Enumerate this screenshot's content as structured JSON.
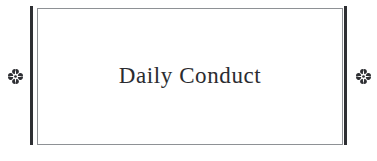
{
  "page": {
    "background_color": "#ffffff",
    "width": 377,
    "height": 161
  },
  "frame": {
    "name": "decorative-rule-box",
    "border_color": "#8e9195",
    "fill_color": "#ffffff",
    "rule_color": "#2e2f33"
  },
  "heading": {
    "text": "Daily Conduct",
    "color": "#2b2c30"
  },
  "ornaments": {
    "icon": "quatrefoil-floret-ornament",
    "color": "#2e2f33",
    "left": {
      "label": "quatrefoil-floret-ornament"
    },
    "right": {
      "label": "quatrefoil-floret-ornament"
    }
  }
}
